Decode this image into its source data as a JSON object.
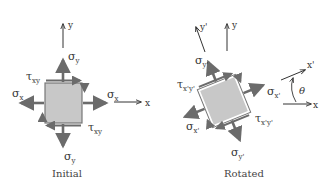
{
  "diagram": {
    "colors": {
      "arrow": "#6b6b6b",
      "square_fill": "#c8c8c8",
      "axis": "#333333",
      "text": "#333333"
    },
    "initial": {
      "caption": "Initial",
      "axis_x": "x",
      "axis_y": "y",
      "sigma_x": "σ",
      "sigma_x_sub": "x",
      "sigma_y": "σ",
      "sigma_y_sub": "y",
      "tau": "τ",
      "tau_sub": "xy"
    },
    "rotated": {
      "caption": "Rotated",
      "axis_x": "x",
      "axis_y": "y",
      "axis_x_prime": "x'",
      "axis_y_prime": "y'",
      "angle": "θ",
      "sigma_x": "σ",
      "sigma_x_sub": "x'",
      "sigma_y": "σ",
      "sigma_y_sub": "y'",
      "tau": "τ",
      "tau_sub": "x'y'"
    }
  }
}
